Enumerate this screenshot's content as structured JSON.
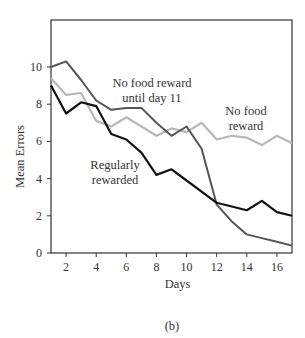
{
  "chart_data": {
    "type": "line",
    "title": "",
    "caption": "(b)",
    "xlabel": "Days",
    "ylabel": "Mean Errors",
    "x": [
      1,
      2,
      3,
      4,
      5,
      6,
      7,
      8,
      9,
      10,
      11,
      12,
      13,
      14,
      15,
      16,
      17
    ],
    "xlim": [
      1,
      17
    ],
    "ylim": [
      0,
      12
    ],
    "xticks": [
      2,
      4,
      6,
      8,
      10,
      12,
      14,
      16
    ],
    "yticks": [
      0,
      2,
      4,
      6,
      8,
      10
    ],
    "grid": false,
    "legend": "inline annotations",
    "series": [
      {
        "name": "Regularly rewarded",
        "color": "#111111",
        "label_lines": [
          "Regularly",
          "rewarded"
        ],
        "values": [
          9.0,
          7.5,
          8.1,
          7.9,
          6.4,
          6.1,
          5.4,
          4.2,
          4.5,
          3.9,
          3.3,
          2.7,
          2.5,
          2.3,
          2.8,
          2.2,
          2.0
        ]
      },
      {
        "name": "No food reward",
        "color": "#b8b8b8",
        "label_lines": [
          "No food",
          "reward"
        ],
        "values": [
          9.4,
          8.5,
          8.6,
          7.1,
          6.8,
          7.3,
          6.8,
          6.3,
          6.7,
          6.5,
          7.0,
          6.1,
          6.3,
          6.2,
          5.8,
          6.3,
          5.9
        ]
      },
      {
        "name": "No food reward until day 11",
        "color": "#555555",
        "label_lines": [
          "No food reward",
          "until day 11"
        ],
        "values": [
          10.0,
          10.3,
          9.3,
          8.2,
          7.7,
          7.8,
          7.8,
          7.0,
          6.3,
          6.8,
          5.6,
          2.6,
          1.7,
          1.0,
          0.8,
          0.6,
          0.4
        ]
      }
    ]
  }
}
